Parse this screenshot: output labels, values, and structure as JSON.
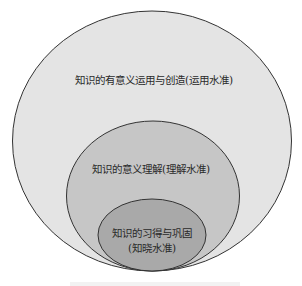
{
  "diagram": {
    "type": "nested-circles",
    "levels": [
      {
        "id": "outer",
        "text": "知识的有意义运用与创造(运用水准)",
        "fill": "#e4e4e4"
      },
      {
        "id": "middle",
        "text": "知识的意义理解(理解水准)",
        "fill": "#c6c6c6"
      },
      {
        "id": "inner",
        "line1": "知识的习得与巩固",
        "line2": "(知晓水准)",
        "fill": "#a9a9a9"
      }
    ],
    "stroke": "#333333"
  }
}
